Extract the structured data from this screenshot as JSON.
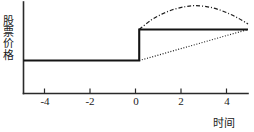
{
  "chart_data": {
    "type": "line",
    "title": "",
    "xlabel": "时间",
    "ylabel": "股票价格",
    "xlim": [
      -5,
      4.7
    ],
    "ylim": [
      0,
      1
    ],
    "grid": false,
    "legend": "none",
    "xticks": [
      -4,
      -2,
      0,
      2,
      4
    ],
    "xticklabels": [
      "-4",
      "-2",
      "0",
      "2",
      "4"
    ],
    "yticks": [],
    "yticklabels": [],
    "event_time": 0,
    "pre_event_price": 0.36,
    "post_event_price": 0.7,
    "series": [
      {
        "name": "efficient-market-response",
        "style": "solid",
        "x": [
          -5.0,
          0.0,
          0.0,
          4.7
        ],
        "values": [
          0.36,
          0.36,
          0.7,
          0.7
        ]
      },
      {
        "name": "overreaction-response",
        "style": "dash-dot",
        "x": [
          0.0,
          0.5,
          1.0,
          1.5,
          2.0,
          2.4,
          2.9,
          3.4,
          3.9,
          4.3,
          4.7
        ],
        "values": [
          0.7,
          0.8,
          0.87,
          0.92,
          0.95,
          0.96,
          0.95,
          0.92,
          0.87,
          0.82,
          0.76
        ]
      },
      {
        "name": "delayed-response",
        "style": "dotted",
        "x": [
          0.0,
          4.7
        ],
        "values": [
          0.36,
          0.7
        ]
      }
    ]
  },
  "axes": {
    "x_axis_name": "时间",
    "y_axis_name": "股票价格"
  }
}
